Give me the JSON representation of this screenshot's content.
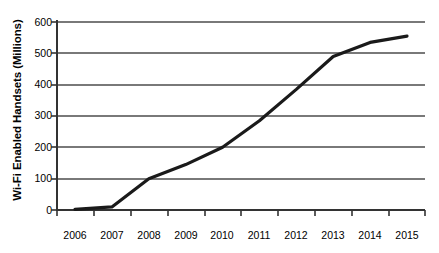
{
  "chart_data": {
    "type": "line",
    "title": "",
    "xlabel": "",
    "ylabel": "Wi-Fi Enabled Handsets (Millions)",
    "categories": [
      "2006",
      "2007",
      "2008",
      "2009",
      "2010",
      "2011",
      "2012",
      "2013",
      "2014",
      "2015"
    ],
    "values": [
      2,
      10,
      100,
      145,
      200,
      285,
      385,
      490,
      535,
      555
    ],
    "series": [
      {
        "name": "Wi-Fi Enabled Handsets",
        "values": [
          2,
          10,
          100,
          145,
          200,
          285,
          385,
          490,
          535,
          555
        ]
      }
    ],
    "ylim": [
      0,
      600
    ],
    "yticks": [
      0,
      100,
      200,
      300,
      400,
      500,
      600
    ],
    "ytick_labels": [
      "0",
      "100",
      "200",
      "300",
      "400",
      "500",
      "600"
    ],
    "grid": true,
    "grid_axis": "y",
    "legend": false,
    "line_color": "#1a1a1a",
    "grid_color": "#4d4d4d",
    "axis_color": "#333333",
    "background": "#ffffff"
  }
}
